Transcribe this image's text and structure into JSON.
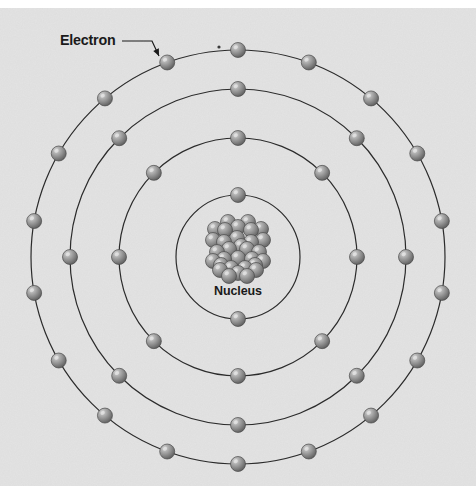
{
  "figure": {
    "background_color": "#e2e2e2",
    "top_strip_color": "#ffffff",
    "line_color": "#2b2b2b",
    "text_color": "#1a1a1a",
    "electron_color_light": "#bdbdbd",
    "electron_color_mid": "#8b8b8b",
    "electron_color_dark": "#5a5a5a",
    "nucleon_color_light": "#c4c4c4",
    "nucleon_color_dark": "#5f5f5f"
  },
  "labels": {
    "electron": "Electron",
    "nucleus": "Nucleus"
  },
  "callout": {
    "electron_label_x": 60,
    "electron_label_y": 45,
    "leader_from_x": 122,
    "leader_from_y": 41,
    "leader_bend_x": 152,
    "leader_bend_y": 41,
    "leader_to_x": 159,
    "leader_to_y": 56
  },
  "chart_data": {
    "type": "diagram",
    "center": {
      "x": 238,
      "y": 257
    },
    "nucleus": {
      "label": "Nucleus",
      "label_x": 238,
      "label_y": 295,
      "nucleon_count": 31,
      "nucleon_radius": 7.5,
      "cluster_radius": 26
    },
    "shells": [
      {
        "index": 1,
        "name": "K",
        "radius": 62,
        "electron_count": 2,
        "start_angle": -90,
        "electron_radius": 7.5
      },
      {
        "index": 2,
        "name": "L",
        "radius": 119,
        "electron_count": 8,
        "start_angle": -90,
        "electron_radius": 7.5
      },
      {
        "index": 3,
        "name": "M",
        "radius": 168,
        "electron_count": 8,
        "start_angle": -90,
        "electron_radius": 7.5
      },
      {
        "index": 4,
        "name": "N",
        "radius": 207,
        "electron_count": 18,
        "start_angle": -90,
        "electron_radius": 7.5
      }
    ],
    "total_electrons": 36,
    "shell_occupancy": [
      2,
      8,
      8,
      18
    ],
    "nucleon_offsets": [
      [
        0,
        -22
      ],
      [
        13,
        -19
      ],
      [
        -13,
        -19
      ],
      [
        -1,
        -11
      ],
      [
        13,
        -7
      ],
      [
        -14,
        -7
      ],
      [
        25,
        -9
      ],
      [
        -25,
        -9
      ],
      [
        9,
        0
      ],
      [
        -9,
        0
      ],
      [
        21,
        3
      ],
      [
        -21,
        3
      ],
      [
        0,
        9
      ],
      [
        14,
        10
      ],
      [
        -14,
        10
      ],
      [
        25,
        12
      ],
      [
        -25,
        12
      ],
      [
        7,
        19
      ],
      [
        -7,
        19
      ],
      [
        18,
        21
      ],
      [
        -18,
        21
      ],
      [
        0,
        24
      ],
      [
        10,
        -27
      ],
      [
        -10,
        -27
      ],
      [
        23,
        -20
      ],
      [
        -23,
        -20
      ],
      [
        3,
        -3
      ],
      [
        17,
        16
      ],
      [
        -17,
        16
      ],
      [
        9,
        27
      ],
      [
        -9,
        27
      ]
    ],
    "stray_speck": {
      "x": 219,
      "y": 47,
      "r": 1.6
    }
  }
}
